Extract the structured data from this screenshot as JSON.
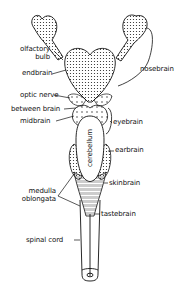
{
  "diagram": {
    "labels": {
      "olfactory_bulb": "olfactory\nbulb",
      "olfactory_bulb_l1": "olfactory",
      "olfactory_bulb_l2": "bulb",
      "endbrain": "endbrain",
      "nosebrain": "nosebrain",
      "optic_nerve": "optic nerve",
      "between_brain": "between brain",
      "midbrain": "midbrain",
      "eyebrain": "eyebrain",
      "cerebellum": "cerebellum",
      "earbrain": "earbrain",
      "skinbrain": "skinbrain",
      "medulla_oblongata_l1": "medulla",
      "medulla_oblongata_l2": "oblongata",
      "tastebrain": "tastebrain",
      "spinal_cord": "spinal cord"
    },
    "colors": {
      "ink": "#111111",
      "background": "#ffffff"
    }
  }
}
